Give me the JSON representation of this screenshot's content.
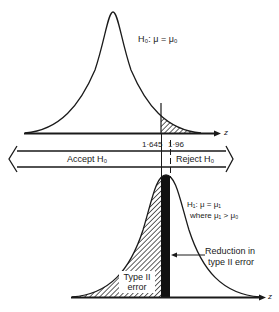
{
  "diagram": {
    "top_curve": {
      "hypothesis_label": "H₀: μ = μ₀",
      "axis_label": "z",
      "critical_values": [
        "1·645",
        "1·96"
      ]
    },
    "decision_bar": {
      "accept_label": "Accept H₀",
      "reject_label": "Reject H₀"
    },
    "bottom_curve": {
      "hypothesis_label_line1": "H₁: μ = μ₁",
      "hypothesis_label_line2": "where μ₁ > μ₀",
      "axis_label": "z",
      "reduction_label_line1": "Reduction in",
      "reduction_label_line2": "type II error",
      "type2_label_line1": "Type II",
      "type2_label_line2": "error"
    },
    "colors": {
      "ink": "#1a1a1a",
      "background": "#ffffff"
    }
  }
}
